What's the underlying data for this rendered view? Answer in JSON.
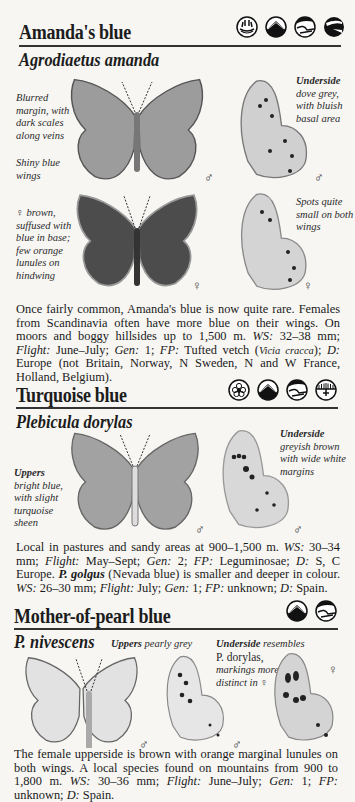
{
  "species": [
    {
      "common_name": "Amanda's blue",
      "latin_name": "Agrodiaetus amanda",
      "habitat_icons": [
        "sun-coast-icon",
        "mountain-icon",
        "hillside-icon",
        "slope-icon"
      ],
      "captions": {
        "left_top": "Blurred margin, with dark scales along veins",
        "left_bottom": "Shiny blue wings",
        "underside_title": "Underside",
        "underside_text": "dove grey, with bluish basal area",
        "female_left": "♀ brown, suffused with blue in base; few orange lunules on hindwing",
        "female_right": "Spots quite small on both wings"
      },
      "sex_marks": [
        "♂",
        "♂",
        "♀",
        "♀"
      ],
      "description": {
        "p1": "Once fairly common, Amanda's blue is now quite rare. Females from Scandinavia often have more blue on their wings. On moors and boggy hillsides up to 1,500 m. ",
        "ws_label": "WS:",
        "ws": " 32–38 mm; ",
        "flight_label": "Flight:",
        "flight": " June–July; ",
        "gen_label": "Gen:",
        "gen": " 1; ",
        "fp_label": "FP:",
        "fp": " Tufted vetch (",
        "fp_latin": "Vicia cracca",
        "fp_end": "); ",
        "d_label": "D:",
        "d": " Europe (not Britain, Norway, N Sweden, N and W France, Holland, Belgium)."
      }
    },
    {
      "common_name": "Turquoise blue",
      "latin_name": "Plebicula dorylas",
      "habitat_icons": [
        "flower-meadow-icon",
        "mountain-icon",
        "hillside-icon",
        "grassland-icon"
      ],
      "captions": {
        "uppers_title": "Uppers",
        "uppers_text": "bright blue, with slight turquoise sheen",
        "underside_title": "Underside",
        "underside_text": "greyish brown with wide white margins"
      },
      "sex_marks": [
        "♂",
        "♂"
      ],
      "description": {
        "p1": "Local in pastures and sandy areas at 900–1,500 m. ",
        "ws_label": "WS:",
        "ws": " 30–34 mm; ",
        "flight_label": "Flight:",
        "flight": " May–Sept; ",
        "gen_label": "Gen:",
        "gen": " 2; ",
        "fp_label": "FP:",
        "fp": " Leguminosae; ",
        "d_label": "D:",
        "d": " S, C Europe.",
        "alt_name": "P. golgus",
        "alt_text": " (Nevada blue) is smaller and deeper in colour. ",
        "alt_ws_label": "WS:",
        "alt_ws": " 26–30 mm; ",
        "alt_flight_label": "Flight:",
        "alt_flight": " July; ",
        "alt_gen_label": "Gen:",
        "alt_gen": " 1; ",
        "alt_fp_label": "FP:",
        "alt_fp": " unknown; ",
        "alt_d_label": "D:",
        "alt_d": " Spain."
      }
    },
    {
      "common_name": "Mother-of-pearl blue",
      "latin_name": "P. nivescens",
      "habitat_icons": [
        "mountain-icon",
        "hillside-icon"
      ],
      "captions": {
        "uppers_title": "Uppers",
        "uppers_text": " pearly grey",
        "underside_title": "Underside",
        "underside_text": " resembles",
        "underside_ref": "P. dorylas,",
        "underside_more": "markings more distinct in ♀"
      },
      "sex_marks": [
        "♂",
        "♂",
        "♀"
      ],
      "description": {
        "p1": "The female upperside is brown with orange marginal lunules on both wings. A local species found on mountains from 900 to 1,800 m. ",
        "ws_label": "WS:",
        "ws": " 30–36 mm; ",
        "flight_label": "Flight:",
        "flight": " June–July; ",
        "gen_label": "Gen:",
        "gen": " 1; ",
        "fp_label": "FP:",
        "fp": " unknown; ",
        "d_label": "D:",
        "d": " Spain."
      }
    }
  ],
  "colors": {
    "male_blue_grey": "#9a9a9a",
    "female_dark": "#4a4a4a",
    "underside_light": "#d2d2d2",
    "pearly": "#dedede",
    "ink": "#1c1c1c"
  }
}
